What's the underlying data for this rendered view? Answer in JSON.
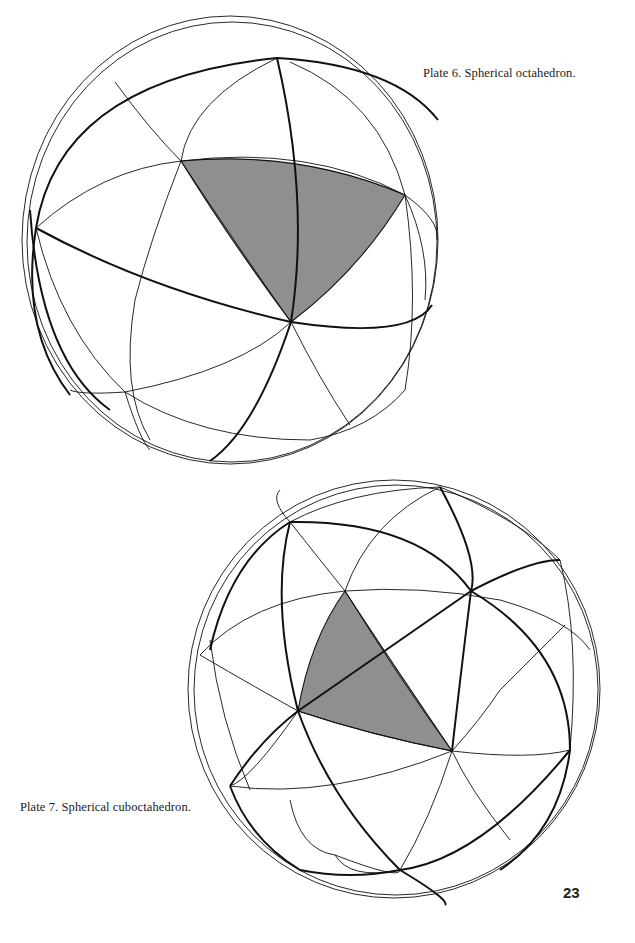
{
  "page": {
    "page_number": "23"
  },
  "plates": [
    {
      "id": "plate-6",
      "caption": "Plate 6.  Spherical octahedron.",
      "figure": "spherical-octahedron",
      "shaded_face_color": "#8f8f8f"
    },
    {
      "id": "plate-7",
      "caption": "Plate 7.  Spherical cuboctahedron.",
      "figure": "spherical-cuboctahedron",
      "shaded_face_color": "#8a8a8a"
    }
  ]
}
